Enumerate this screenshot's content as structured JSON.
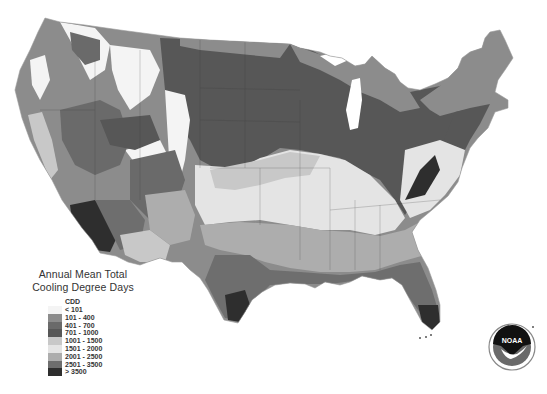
{
  "title_line1": "Annual Mean Total",
  "title_line2": "Cooling Degree Days",
  "legend": {
    "unit": "CDD",
    "classes": [
      {
        "label": "< 101",
        "color": "#f4f4f4"
      },
      {
        "label": "101 - 400",
        "color": "#8c8c8c"
      },
      {
        "label": "401 - 700",
        "color": "#6a6a6a"
      },
      {
        "label": "701 - 1000",
        "color": "#575757"
      },
      {
        "label": "1001 - 1500",
        "color": "#c8c8c8"
      },
      {
        "label": "1501 - 2000",
        "color": "#e4e4e4"
      },
      {
        "label": "2001 - 2500",
        "color": "#adadad"
      },
      {
        "label": "2501 - 3500",
        "color": "#6e6e6e"
      },
      {
        "label": "> 3500",
        "color": "#2e2e2e"
      }
    ]
  },
  "logo": {
    "text": "NOAA"
  },
  "map": {
    "region": "Contiguous United States",
    "colors": {
      "c0": "#f4f4f4",
      "c1": "#8c8c8c",
      "c2": "#6a6a6a",
      "c3": "#575757",
      "c4": "#c8c8c8",
      "c5": "#e4e4e4",
      "c6": "#adadad",
      "c7": "#6e6e6e",
      "c8": "#2e2e2e"
    }
  }
}
